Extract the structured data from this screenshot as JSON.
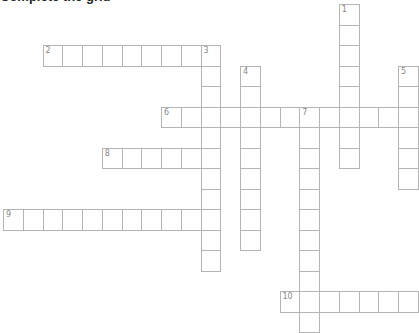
{
  "heading": "Complete the grid",
  "grid": {
    "cell_w": 19.75,
    "cell_h": 20.5,
    "origin_x": 3,
    "origin_y": 4,
    "line_color": "#b4b4b4",
    "number_color": "#888888"
  },
  "entries": [
    {
      "number": "1",
      "direction": "down",
      "row": 0,
      "col": 17,
      "length": 8
    },
    {
      "number": "2",
      "direction": "across",
      "row": 2,
      "col": 2,
      "length": 9
    },
    {
      "number": "3",
      "direction": "down",
      "row": 2,
      "col": 10,
      "length": 11
    },
    {
      "number": "4",
      "direction": "down",
      "row": 3,
      "col": 12,
      "length": 9
    },
    {
      "number": "5",
      "direction": "down",
      "row": 3,
      "col": 20,
      "length": 6
    },
    {
      "number": "6",
      "direction": "across",
      "row": 5,
      "col": 8,
      "length": 13
    },
    {
      "number": "7",
      "direction": "down",
      "row": 5,
      "col": 15,
      "length": 11
    },
    {
      "number": "8",
      "direction": "across",
      "row": 7,
      "col": 5,
      "length": 6
    },
    {
      "number": "9",
      "direction": "across",
      "row": 10,
      "col": 0,
      "length": 11
    },
    {
      "number": "10",
      "direction": "across",
      "row": 14,
      "col": 14,
      "length": 7
    }
  ]
}
